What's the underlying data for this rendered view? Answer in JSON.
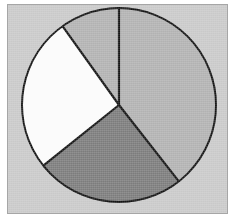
{
  "figure": {
    "panel_background": "#c9c9c9",
    "panel_border": "#a6a6a6",
    "outline_color": "#141414"
  },
  "chart_data": {
    "type": "pie",
    "title": "",
    "subtitle": "",
    "xlabel": "",
    "ylabel": "",
    "legend": [],
    "grid": false,
    "start_angle_deg": 0,
    "direction": "clockwise",
    "categories": [
      "Slice 1",
      "Slice 2",
      "Slice 3",
      "Slice 4"
    ],
    "values": [
      39.4,
      24.7,
      25.9,
      10.0
    ],
    "angles_deg": [
      141.9,
      89.4,
      93.1,
      35.6
    ],
    "boundaries_deg": [
      0,
      141.9,
      231.3,
      324.4,
      360
    ],
    "colors": [
      "#b2b2b2",
      "#7c7c7c",
      "#fbfbfb",
      "#b2b2b2"
    ],
    "slice_labels": [
      "",
      "",
      "",
      ""
    ],
    "annotations": []
  }
}
